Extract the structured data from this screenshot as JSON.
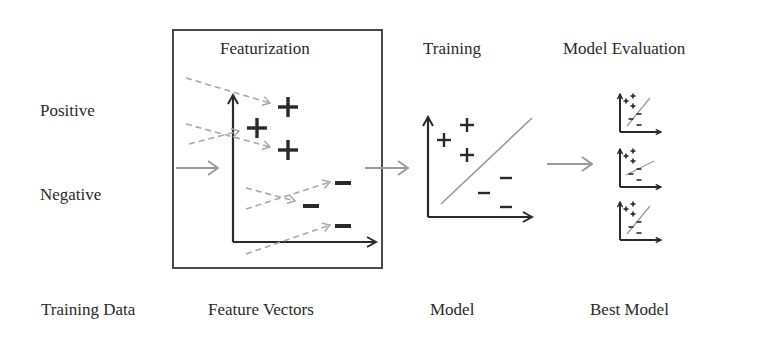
{
  "stages": {
    "featurization": {
      "title": "Featurization",
      "caption": "Feature Vectors"
    },
    "training": {
      "title": "Training",
      "caption": "Model"
    },
    "evaluation": {
      "title": "Model Evaluation",
      "caption": "Best Model"
    },
    "input": {
      "caption": "Training Data"
    }
  },
  "classes": {
    "positive": "Positive",
    "negative": "Negative"
  },
  "symbols": {
    "plus": "+",
    "minus": "−"
  },
  "colors": {
    "ink": "#2a2a2a",
    "arrow_gray": "#9a9a9a",
    "dashed_gray": "#a8a8a8",
    "box_border": "#4a4a4a",
    "background": "#ffffff"
  },
  "featurization_points": {
    "positive": [
      {
        "x": 288,
        "y": 107
      },
      {
        "x": 257,
        "y": 128
      },
      {
        "x": 288,
        "y": 150
      }
    ],
    "negative": [
      {
        "x": 343,
        "y": 183
      },
      {
        "x": 311,
        "y": 206
      },
      {
        "x": 343,
        "y": 226
      }
    ]
  },
  "training_points": {
    "positive": [
      {
        "x": 467,
        "y": 125
      },
      {
        "x": 444,
        "y": 140
      },
      {
        "x": 467,
        "y": 155
      }
    ],
    "negative": [
      {
        "x": 506,
        "y": 178
      },
      {
        "x": 484,
        "y": 193
      },
      {
        "x": 506,
        "y": 207
      }
    ]
  },
  "evaluation_models": [
    {
      "id": "model-1",
      "top": 90,
      "line_slope": "steep"
    },
    {
      "id": "model-2",
      "top": 145,
      "line_slope": "shallow"
    },
    {
      "id": "model-3",
      "top": 198,
      "line_slope": "steep"
    }
  ]
}
